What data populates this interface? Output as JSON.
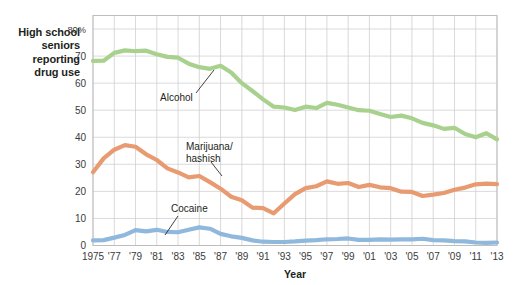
{
  "figure": {
    "side_caption_lines": [
      "High school",
      "seniors",
      "reporting",
      "drug use"
    ],
    "x_axis_title": "Year"
  },
  "colors": {
    "alcohol": "#a9d18e",
    "marijuana": "#e89a70",
    "cocaine": "#8fb8dc",
    "grid": "#d2d2d2",
    "frame": "#bdbdbd",
    "text": "#231f20",
    "tick_text": "#3a3a3a",
    "background": "#ffffff"
  },
  "chart_data": {
    "type": "line",
    "title": "",
    "xlabel": "Year",
    "ylabel": "High school seniors reporting drug use",
    "xlim": [
      1975,
      2013
    ],
    "ylim": [
      0,
      85
    ],
    "grid": true,
    "legend": "inline-annotations",
    "ytick_values": [
      0,
      10,
      20,
      30,
      40,
      50,
      60,
      70,
      80
    ],
    "ytick_labels": [
      "0",
      "10",
      "20",
      "30",
      "40",
      "50",
      "60",
      "70",
      "80%"
    ],
    "xtick_values": [
      1975,
      1977,
      1979,
      1981,
      1983,
      1985,
      1987,
      1989,
      1991,
      1993,
      1995,
      1997,
      1999,
      2001,
      2003,
      2005,
      2007,
      2009,
      2011,
      2013
    ],
    "xtick_labels": [
      "1975",
      "'77",
      "'79",
      "'81",
      "'83",
      "'85",
      "'87",
      "'89",
      "'91",
      "'93",
      "'95",
      "'97",
      "'99",
      "'01",
      "'03",
      "'05",
      "'07",
      "'09",
      "'11",
      "'13"
    ],
    "x": [
      1975,
      1976,
      1977,
      1978,
      1979,
      1980,
      1981,
      1982,
      1983,
      1984,
      1985,
      1986,
      1987,
      1988,
      1989,
      1990,
      1991,
      1992,
      1993,
      1994,
      1995,
      1996,
      1997,
      1998,
      1999,
      2000,
      2001,
      2002,
      2003,
      2004,
      2005,
      2006,
      2007,
      2008,
      2009,
      2010,
      2011,
      2012,
      2013
    ],
    "series": [
      {
        "name": "Alcohol",
        "color": "#a9d18e",
        "label_text": "Alcohol",
        "values": [
          68.2,
          68.3,
          71.2,
          72.1,
          71.8,
          72.0,
          70.7,
          69.7,
          69.4,
          67.2,
          65.9,
          65.3,
          66.4,
          63.9,
          60.0,
          57.1,
          54.0,
          51.3,
          51.0,
          50.1,
          51.3,
          50.8,
          52.7,
          52.0,
          51.0,
          50.0,
          49.8,
          48.6,
          47.5,
          48.0,
          47.0,
          45.3,
          44.4,
          43.1,
          43.5,
          41.2,
          40.0,
          41.5,
          39.2
        ]
      },
      {
        "name": "Marijuana/hashish",
        "color": "#e89a70",
        "label_text": [
          "Marijuana/",
          "hashish"
        ],
        "values": [
          27.1,
          32.2,
          35.4,
          37.1,
          36.5,
          33.7,
          31.6,
          28.5,
          27.0,
          25.2,
          25.7,
          23.4,
          21.0,
          18.0,
          16.7,
          14.0,
          13.8,
          11.9,
          15.5,
          19.0,
          21.2,
          21.9,
          23.7,
          22.8,
          23.1,
          21.6,
          22.4,
          21.5,
          21.2,
          19.9,
          19.8,
          18.3,
          18.8,
          19.4,
          20.6,
          21.4,
          22.6,
          22.9,
          22.7
        ]
      },
      {
        "name": "Cocaine",
        "color": "#8fb8dc",
        "label_text": "Cocaine",
        "values": [
          1.9,
          2.0,
          2.9,
          3.9,
          5.7,
          5.2,
          5.8,
          5.0,
          4.9,
          5.8,
          6.7,
          6.2,
          4.3,
          3.4,
          2.8,
          1.9,
          1.4,
          1.3,
          1.3,
          1.5,
          1.8,
          2.0,
          2.3,
          2.4,
          2.6,
          2.1,
          2.1,
          2.3,
          2.2,
          2.3,
          2.3,
          2.5,
          2.0,
          1.9,
          1.6,
          1.5,
          1.1,
          1.0,
          1.1
        ]
      }
    ],
    "annotations": [
      {
        "series": "Alcohol",
        "text": "Alcohol",
        "x": 1983.5,
        "y": 55.5
      },
      {
        "series": "Marijuana/hashish",
        "text": "Marijuana/ hashish",
        "x": 1985.0,
        "y": 36.0
      },
      {
        "series": "Cocaine",
        "text": "Cocaine",
        "x": 1981.5,
        "y": 13.5
      }
    ]
  }
}
